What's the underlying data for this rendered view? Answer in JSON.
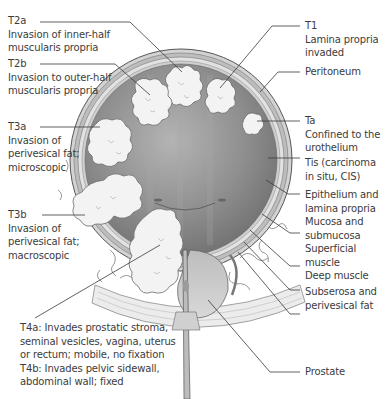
{
  "diagram": {
    "left_labels": [
      {
        "id": "t2a",
        "code": "T2a",
        "desc": [
          "Invasion of inner-half",
          "muscularis propria"
        ]
      },
      {
        "id": "t2b",
        "code": "T2b",
        "desc": [
          "Invasion to outer-half",
          "muscularis propria"
        ]
      },
      {
        "id": "t3a",
        "code": "T3a",
        "desc": [
          "Invasion of",
          "perivesical fat;",
          "microscopic"
        ]
      },
      {
        "id": "t3b",
        "code": "T3b",
        "desc": [
          "Invasion of",
          "perivesical fat;",
          "macroscopic"
        ]
      }
    ],
    "t4_label": {
      "lines": [
        "T4a: Invades prostatic stroma,",
        "seminal vesicles, vagina, uterus",
        "or rectum; mobile, no fixation",
        "T4b: Invades pelvic sidewall,",
        "abdominal wall; fixed"
      ]
    },
    "right_labels": [
      {
        "id": "t1",
        "code": "T1",
        "desc": [
          "Lamina propria",
          "invaded"
        ]
      },
      {
        "id": "peritoneum",
        "code": "",
        "desc": [
          "Peritoneum"
        ]
      },
      {
        "id": "ta",
        "code": "Ta",
        "desc": [
          "Confined to the",
          "urothelium"
        ]
      },
      {
        "id": "tis",
        "code": "",
        "desc": [
          "Tis (carcinoma",
          "in situ, CIS)"
        ]
      },
      {
        "id": "epithelium",
        "code": "",
        "desc": [
          "Epithelium and",
          "lamina propria"
        ]
      },
      {
        "id": "mucosa",
        "code": "",
        "desc": [
          "Mucosa and",
          "submucosa"
        ]
      },
      {
        "id": "superficial-muscle",
        "code": "",
        "desc": [
          "Superficial",
          "muscle"
        ]
      },
      {
        "id": "deep-muscle",
        "code": "",
        "desc": [
          "Deep muscle"
        ]
      },
      {
        "id": "subserosa",
        "code": "",
        "desc": [
          "Subserosa and",
          "perivesical fat"
        ]
      },
      {
        "id": "prostate",
        "code": "",
        "desc": [
          "Prostate"
        ]
      }
    ],
    "colors": {
      "bladder_lumen": "#8c8c8c",
      "bladder_wall": "#bdbdbd",
      "tumor": "#f2f2f2",
      "leader_line": "#3a3a3a",
      "text": "#3c3c3c"
    }
  }
}
